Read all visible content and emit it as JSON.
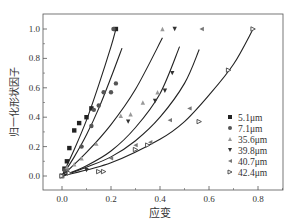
{
  "chart_data": {
    "type": "scatter",
    "title": "",
    "xlabel": "应变",
    "ylabel": "归一化形状因子",
    "xlim": [
      -0.05,
      0.9
    ],
    "ylim": [
      -0.1,
      1.1
    ],
    "xticks": [
      "0.0",
      "0.2",
      "0.4",
      "0.6",
      "0.8"
    ],
    "yticks": [
      "0.0",
      "0.2",
      "0.4",
      "0.6",
      "0.8",
      "1.0"
    ],
    "grid": false,
    "legend_position": "lower right",
    "series": [
      {
        "name": "5.1μm",
        "marker": "square",
        "color": "#222222",
        "points": [
          [
            0.0,
            0.0
          ],
          [
            0.01,
            0.05
          ],
          [
            0.02,
            0.1
          ],
          [
            0.03,
            0.19
          ],
          [
            0.05,
            0.31
          ],
          [
            0.07,
            0.36
          ],
          [
            0.1,
            0.4
          ],
          [
            0.12,
            0.46
          ],
          [
            0.22,
            1.0
          ]
        ],
        "fit": [
          [
            0.0,
            0.0
          ],
          [
            0.05,
            0.18
          ],
          [
            0.1,
            0.38
          ],
          [
            0.15,
            0.62
          ],
          [
            0.2,
            0.88
          ],
          [
            0.22,
            1.0
          ]
        ]
      },
      {
        "name": "7.1μm",
        "marker": "circle",
        "color": "#555555",
        "points": [
          [
            0.0,
            0.0
          ],
          [
            0.01,
            0.04
          ],
          [
            0.08,
            0.2
          ],
          [
            0.12,
            0.34
          ],
          [
            0.13,
            0.45
          ],
          [
            0.15,
            0.48
          ],
          [
            0.17,
            0.57
          ],
          [
            0.2,
            0.57
          ],
          [
            0.22,
            0.63
          ],
          [
            0.21,
            1.0
          ]
        ],
        "fit": [
          [
            0.0,
            0.0
          ],
          [
            0.05,
            0.13
          ],
          [
            0.1,
            0.28
          ],
          [
            0.15,
            0.46
          ],
          [
            0.2,
            0.67
          ],
          [
            0.245,
            0.87
          ]
        ]
      },
      {
        "name": "35.6μm",
        "marker": "triangle-up",
        "color": "#999999",
        "points": [
          [
            0.0,
            0.0
          ],
          [
            0.02,
            0.06
          ],
          [
            0.05,
            0.08
          ],
          [
            0.08,
            0.12
          ],
          [
            0.14,
            0.22
          ],
          [
            0.24,
            0.41
          ],
          [
            0.28,
            0.42
          ],
          [
            0.33,
            0.5
          ],
          [
            0.39,
            0.57
          ],
          [
            0.41,
            1.0
          ]
        ],
        "fit": [
          [
            0.0,
            0.0
          ],
          [
            0.1,
            0.16
          ],
          [
            0.2,
            0.35
          ],
          [
            0.3,
            0.59
          ],
          [
            0.41,
            0.94
          ]
        ]
      },
      {
        "name": "39.8μm",
        "marker": "triangle-down",
        "color": "#333333",
        "points": [
          [
            0.0,
            0.0
          ],
          [
            0.02,
            0.03
          ],
          [
            0.1,
            0.04
          ],
          [
            0.27,
            0.37
          ],
          [
            0.38,
            0.51
          ],
          [
            0.42,
            0.58
          ],
          [
            0.45,
            0.7
          ],
          [
            0.46,
            1.0
          ]
        ],
        "fit": [
          [
            0.0,
            0.0
          ],
          [
            0.1,
            0.07
          ],
          [
            0.2,
            0.17
          ],
          [
            0.3,
            0.33
          ],
          [
            0.4,
            0.56
          ],
          [
            0.48,
            0.88
          ]
        ]
      },
      {
        "name": "40.7μm",
        "marker": "triangle-left",
        "color": "#777777",
        "points": [
          [
            0.0,
            0.0
          ],
          [
            0.02,
            0.04
          ],
          [
            0.2,
            0.12
          ],
          [
            0.3,
            0.21
          ],
          [
            0.36,
            0.23
          ],
          [
            0.44,
            0.38
          ],
          [
            0.52,
            0.46
          ],
          [
            0.57,
            1.0
          ]
        ],
        "fit": [
          [
            0.0,
            0.0
          ],
          [
            0.1,
            0.06
          ],
          [
            0.2,
            0.13
          ],
          [
            0.3,
            0.24
          ],
          [
            0.4,
            0.4
          ],
          [
            0.5,
            0.63
          ],
          [
            0.56,
            0.86
          ]
        ]
      },
      {
        "name": "42.4μm",
        "marker": "triangle-right",
        "color": "#444444",
        "points": [
          [
            0.0,
            0.0
          ],
          [
            0.03,
            0.02
          ],
          [
            0.15,
            0.03
          ],
          [
            0.17,
            0.03
          ],
          [
            0.3,
            0.18
          ],
          [
            0.35,
            0.21
          ],
          [
            0.56,
            0.37
          ],
          [
            0.68,
            0.72
          ],
          [
            0.78,
            1.0
          ]
        ],
        "fit": [
          [
            0.0,
            0.0
          ],
          [
            0.2,
            0.09
          ],
          [
            0.4,
            0.25
          ],
          [
            0.5,
            0.37
          ],
          [
            0.6,
            0.55
          ],
          [
            0.7,
            0.76
          ],
          [
            0.78,
            1.0
          ]
        ]
      }
    ]
  }
}
